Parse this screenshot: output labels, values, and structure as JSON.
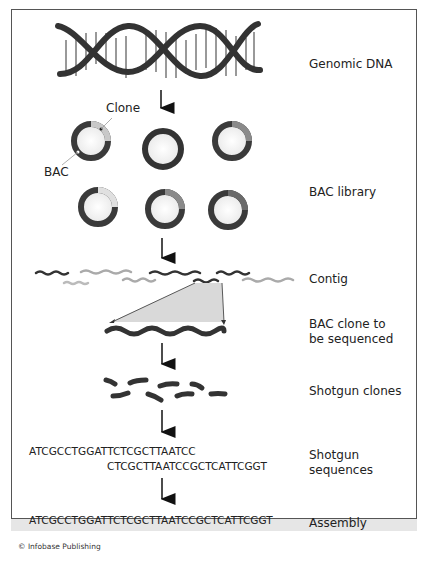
{
  "figure": {
    "steps": [
      {
        "id": "genomic-dna",
        "label": "Genomic DNA"
      },
      {
        "id": "bac-library",
        "label": "BAC library"
      },
      {
        "id": "contig",
        "label": "Contig"
      },
      {
        "id": "bac-clone",
        "label": "BAC clone to be sequenced",
        "lines": [
          "BAC clone to",
          "be sequenced"
        ]
      },
      {
        "id": "shotgun-clones",
        "label": "Shotgun clones"
      },
      {
        "id": "shotgun-sequences",
        "label": "Shotgun sequences",
        "lines": [
          "Shotgun",
          "sequences"
        ]
      },
      {
        "id": "assembly",
        "label": "Assembly"
      }
    ],
    "callouts": {
      "clone": "Clone",
      "bac": "BAC"
    },
    "sequences": {
      "read1": "ATCGCCTGGATTCTCGCTTAATCC",
      "read2": "CTCGCTTAATCCGCTCATTCGGT",
      "assembly": "ATCGCCTGGATTCTCGCTTAATCCGCTCATTCGGT"
    },
    "credit": "© Infobase Publishing",
    "colors": {
      "dark": "#3a3a3a",
      "mid": "#8a8a8a",
      "light": "#c8c8c8",
      "fill": "#d9d9d9"
    }
  }
}
